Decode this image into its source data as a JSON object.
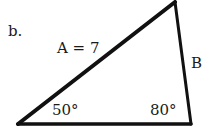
{
  "problem_label": "b.",
  "triangle": {
    "vertices": {
      "bottom_left": [
        18,
        124
      ],
      "top": [
        175,
        1
      ],
      "bottom_right": [
        191,
        124
      ]
    },
    "side_A_label": "A = 7",
    "side_B_label": "B",
    "angle_bottom_left": "50°",
    "angle_bottom_right": "80°",
    "stroke_color": "#111111"
  }
}
